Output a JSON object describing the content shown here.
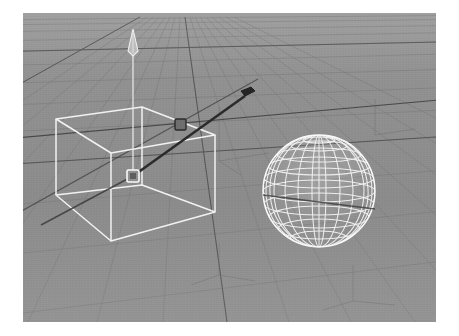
{
  "app": {
    "kind": "3d-modeling-viewport",
    "viewport_label": "Perspective",
    "shading_mode": "Wireframe"
  },
  "canvas": {
    "width": 459,
    "height": 336,
    "margin_color": "#ffffff",
    "viewport": {
      "x": 23,
      "y": 13,
      "width": 413,
      "height": 309
    }
  },
  "colors": {
    "background_far": "#919191",
    "background_near": "#8a8a8a",
    "grid_minor": "#7d7d7d",
    "grid_major": "#4e4e4e",
    "axis_line": "#3a3a3a",
    "wireframe": "#f2f2f2",
    "wireframe_dim": "#d8d8d8",
    "manipulator_handle": "#efefef",
    "manipulator_axis_dark": "#2e2e2e",
    "margin": "#ffffff"
  },
  "scene": {
    "grid": {
      "name": "ground-grid",
      "horizon_y": 4,
      "vanishing_point": {
        "x": 150,
        "y": -58
      },
      "minor_spacing_label": "1 unit",
      "major_every": 5,
      "rows": 22,
      "columns": 26
    },
    "objects": [
      {
        "id": "cube-01",
        "name": "Box",
        "type": "cube",
        "selected": true,
        "display": "wireframe",
        "screen_box": {
          "x": 32,
          "y": 72,
          "width": 170,
          "height": 160
        },
        "vertices_2d": {
          "top_back_left": [
            33,
            106
          ],
          "top_back_right": [
            119,
            94
          ],
          "top_front_right": [
            192,
            122
          ],
          "top_front_left": [
            88,
            140
          ],
          "bot_back_left": [
            33,
            182
          ],
          "bot_back_right": [
            119,
            172
          ],
          "bot_front_right": [
            192,
            199
          ],
          "bot_front_left": [
            88,
            228
          ]
        }
      },
      {
        "id": "sphere-01",
        "name": "Sphere",
        "type": "uv-sphere",
        "selected": false,
        "display": "wireframe",
        "segments": 20,
        "rings": 16,
        "screen_center": [
          296,
          178
        ],
        "screen_radius": 56
      }
    ],
    "manipulator": {
      "name": "move-manipulator",
      "tool": "Move",
      "pivot_screen": [
        110,
        163
      ],
      "handles": [
        {
          "axis": "Y",
          "label": "Y axis handle",
          "tip": [
            110,
            18
          ],
          "shape": "cone-arrow",
          "highlighted": false
        },
        {
          "axis": "X",
          "label": "X axis handle",
          "tip": [
            222,
            83
          ],
          "shape": "box-handle",
          "highlighted": true
        },
        {
          "axis": "Z",
          "label": "Z axis handle",
          "tip": [
            18,
            212
          ],
          "shape": "line",
          "highlighted": false
        },
        {
          "axis": "center",
          "label": "Center / screen-space handle",
          "tip": [
            110,
            163
          ],
          "shape": "square",
          "highlighted": false
        }
      ]
    }
  }
}
